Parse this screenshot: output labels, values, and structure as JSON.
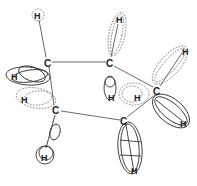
{
  "diagram": {
    "type": "molecular-orbital-lobes",
    "carbon_label": "C",
    "hydrogen_label": "H",
    "carbons": [
      {
        "id": "c1",
        "label": "C",
        "x": 48,
        "y": 63
      },
      {
        "id": "c2",
        "label": "C",
        "x": 110,
        "y": 63
      },
      {
        "id": "c3",
        "label": "C",
        "x": 157,
        "y": 90
      },
      {
        "id": "c4",
        "label": "C",
        "x": 56,
        "y": 110
      },
      {
        "id": "c5",
        "label": "C",
        "x": 124,
        "y": 121
      }
    ],
    "bonds": [
      [
        "c1",
        "c2"
      ],
      [
        "c2",
        "c3"
      ],
      [
        "c1",
        "c4"
      ],
      [
        "c4",
        "c5"
      ],
      [
        "c3",
        "c5"
      ]
    ],
    "hydrogens": [
      {
        "id": "h1",
        "label": "H",
        "x": 38,
        "y": 15,
        "style": "dashed"
      },
      {
        "id": "h2",
        "label": "H",
        "x": 119,
        "y": 19,
        "style": "dashed"
      },
      {
        "id": "h3",
        "label": "H",
        "x": 185,
        "y": 50,
        "style": "dashed"
      },
      {
        "id": "h4",
        "label": "H",
        "x": 15,
        "y": 76,
        "style": "solid"
      },
      {
        "id": "h5",
        "label": "H",
        "x": 24,
        "y": 99,
        "style": "dashed"
      },
      {
        "id": "h6",
        "label": "H",
        "x": 110,
        "y": 97,
        "style": "solid"
      },
      {
        "id": "h7",
        "label": "H",
        "x": 137,
        "y": 97,
        "style": "dashed"
      },
      {
        "id": "h8",
        "label": "H",
        "x": 183,
        "y": 123,
        "style": "solid"
      },
      {
        "id": "h9",
        "label": "H",
        "x": 44,
        "y": 157,
        "style": "solid"
      },
      {
        "id": "h10",
        "label": "H",
        "x": 134,
        "y": 170,
        "style": "solid"
      }
    ]
  }
}
